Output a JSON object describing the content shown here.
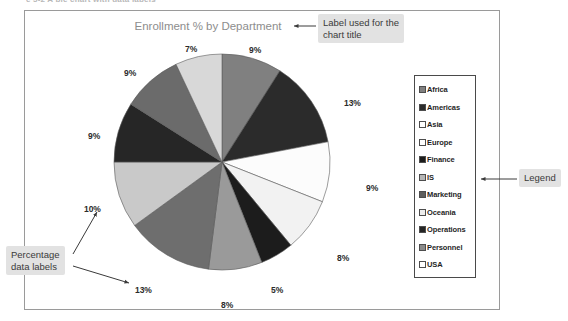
{
  "top_caption": "e 5-2  A pie chart with data labels",
  "chart": {
    "title": "Enrollment % by Department"
  },
  "chart_data": {
    "type": "pie",
    "title": "Enrollment % by Department",
    "legend_position": "right",
    "categories": [
      "Africa",
      "Americas",
      "Asia",
      "Europe",
      "Finance",
      "IS",
      "Marketing",
      "Oceania",
      "Operations",
      "Personnel",
      "USA"
    ],
    "values": [
      9,
      13,
      9,
      8,
      5,
      8,
      13,
      10,
      9,
      9,
      7
    ],
    "labels": [
      "9%",
      "13%",
      "9%",
      "8%",
      "5%",
      "8%",
      "13%",
      "10%",
      "9%",
      "9%",
      "7%"
    ],
    "colors": [
      "#808080",
      "#2b2b2b",
      "#fcfcfc",
      "#f2f2f2",
      "#1c1c1c",
      "#9a9a9a",
      "#6e6e6e",
      "#c9c9c9",
      "#262626",
      "#6b6b6b",
      "#d8d8d8"
    ],
    "data_label_format": "percentage",
    "grid": false
  },
  "legend": {
    "items": [
      {
        "label": "Africa",
        "swatch": "#808080"
      },
      {
        "label": "Americas",
        "swatch": "#2b2b2b"
      },
      {
        "label": "Asia",
        "swatch": "#ffffff"
      },
      {
        "label": "Europe",
        "swatch": "#ffffff"
      },
      {
        "label": "Finance",
        "swatch": "#1c1c1c"
      },
      {
        "label": "IS",
        "swatch": "#b5b5b5"
      },
      {
        "label": "Marketing",
        "swatch": "#5e5e5e"
      },
      {
        "label": "Oceania",
        "swatch": "#ededed"
      },
      {
        "label": "Operations",
        "swatch": "#242424"
      },
      {
        "label": "Personnel",
        "swatch": "#8a8a8a"
      },
      {
        "label": "USA",
        "swatch": "#ffffff"
      }
    ]
  },
  "annotations": {
    "title_callout": "Label used for the\nchart title",
    "title_callout_line1": "Label used for the",
    "title_callout_line2": "chart title",
    "legend_callout": "Legend",
    "pct_callout_line1": "Percentage",
    "pct_callout_line2": "data labels"
  },
  "pie_labels": [
    {
      "text": "9%",
      "x": 249,
      "y": 45
    },
    {
      "text": "13%",
      "x": 344,
      "y": 98
    },
    {
      "text": "9%",
      "x": 366,
      "y": 183
    },
    {
      "text": "8%",
      "x": 337,
      "y": 253
    },
    {
      "text": "5%",
      "x": 271,
      "y": 285
    },
    {
      "text": "8%",
      "x": 221,
      "y": 300
    },
    {
      "text": "13%",
      "x": 135,
      "y": 285
    },
    {
      "text": "10%",
      "x": 84,
      "y": 204
    },
    {
      "text": "9%",
      "x": 88,
      "y": 131
    },
    {
      "text": "9%",
      "x": 124,
      "y": 68
    },
    {
      "text": "7%",
      "x": 185,
      "y": 44
    }
  ]
}
